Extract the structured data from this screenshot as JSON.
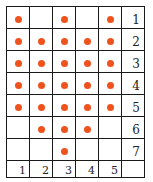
{
  "grid": {
    "rows": 7,
    "cols": 5,
    "dot_color": "#f0521e",
    "row_labels": [
      "1",
      "2",
      "3",
      "4",
      "5",
      "6",
      "7"
    ],
    "col_labels": [
      "1",
      "2",
      "3",
      "4",
      "5"
    ],
    "dots": [
      [
        1,
        0,
        1,
        0,
        1
      ],
      [
        1,
        1,
        1,
        1,
        1
      ],
      [
        1,
        1,
        1,
        1,
        1
      ],
      [
        1,
        1,
        1,
        1,
        1
      ],
      [
        1,
        1,
        1,
        1,
        1
      ],
      [
        0,
        1,
        1,
        1,
        0
      ],
      [
        0,
        0,
        1,
        0,
        0
      ]
    ]
  }
}
